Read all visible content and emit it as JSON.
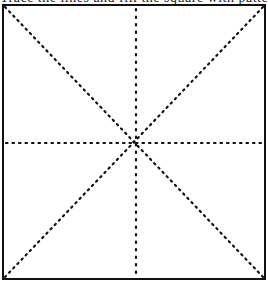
{
  "diagram": {
    "type": "square-with-dotted-guides",
    "top_text_cropped": "Trace the lines and fill the square with pattern",
    "frame": {
      "x": 3,
      "y": 5,
      "width": 262,
      "height": 274,
      "stroke": "#111111"
    },
    "guides": [
      {
        "name": "diagonal-tl-br",
        "style": "dotted"
      },
      {
        "name": "diagonal-tr-bl",
        "style": "dotted"
      },
      {
        "name": "vertical-center",
        "style": "dotted"
      },
      {
        "name": "horizontal-center",
        "style": "dotted"
      }
    ],
    "colors": {
      "line": "#111111",
      "background": "#ffffff"
    }
  }
}
